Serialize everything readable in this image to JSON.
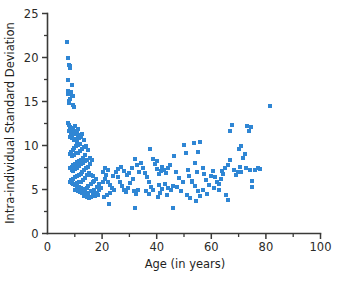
{
  "figure": {
    "background_color": "#ffffff",
    "marker_color": "#2f86d4",
    "axis_color": "#3a3a38",
    "text_color": "#1f1f1e"
  },
  "chart_data": {
    "type": "scatter",
    "title": "",
    "subtitle": "",
    "xlabel": "Age (in years)",
    "ylabel": "Intra-individual Standard Deviation",
    "xlim": [
      0,
      100
    ],
    "ylim": [
      0,
      25
    ],
    "x_major_ticks": [
      0,
      20,
      40,
      60,
      80,
      100
    ],
    "x_minor_ticks": [
      10,
      30,
      50,
      70,
      90
    ],
    "y_major_ticks": [
      0,
      5,
      10,
      15,
      20,
      25
    ],
    "y_minor_ticks": [
      2.5,
      7.5,
      12.5,
      17.5,
      22.5
    ],
    "x_tick_labels": [
      "0",
      "20",
      "40",
      "60",
      "80",
      "100"
    ],
    "y_tick_labels": [
      "0",
      "5",
      "10",
      "15",
      "20",
      "25"
    ],
    "grid": false,
    "legend": null,
    "marker": "square",
    "marker_size": 4,
    "series": [
      {
        "name": "Participants",
        "color": "#2f86d4",
        "points": [
          [
            7.2,
            21.8
          ],
          [
            7.4,
            19.9
          ],
          [
            7.8,
            19.2
          ],
          [
            8.1,
            18.8
          ],
          [
            8.3,
            19.0
          ],
          [
            7.6,
            17.4
          ],
          [
            9.0,
            16.9
          ],
          [
            7.5,
            16.2
          ],
          [
            7.4,
            15.8
          ],
          [
            8.6,
            16.1
          ],
          [
            8.9,
            15.6
          ],
          [
            8.2,
            15.3
          ],
          [
            7.8,
            15.1
          ],
          [
            9.3,
            15.6
          ],
          [
            9.5,
            14.6
          ],
          [
            8.0,
            14.8
          ],
          [
            9.8,
            14.4
          ],
          [
            7.6,
            12.6
          ],
          [
            8.0,
            12.3
          ],
          [
            8.4,
            12.1
          ],
          [
            8.8,
            12.0
          ],
          [
            9.1,
            11.9
          ],
          [
            7.9,
            11.6
          ],
          [
            8.6,
            11.4
          ],
          [
            9.4,
            11.8
          ],
          [
            10.0,
            12.2
          ],
          [
            10.4,
            11.7
          ],
          [
            9.7,
            11.3
          ],
          [
            10.8,
            11.5
          ],
          [
            11.3,
            11.9
          ],
          [
            11.0,
            11.2
          ],
          [
            8.3,
            11.0
          ],
          [
            9.0,
            10.9
          ],
          [
            9.6,
            10.6
          ],
          [
            10.2,
            10.7
          ],
          [
            10.9,
            10.4
          ],
          [
            11.6,
            10.8
          ],
          [
            12.2,
            11.0
          ],
          [
            12.8,
            11.3
          ],
          [
            13.4,
            10.6
          ],
          [
            12.0,
            10.2
          ],
          [
            11.2,
            10.1
          ],
          [
            10.5,
            9.9
          ],
          [
            9.8,
            9.7
          ],
          [
            9.2,
            9.5
          ],
          [
            8.7,
            9.3
          ],
          [
            8.2,
            9.0
          ],
          [
            9.0,
            8.8
          ],
          [
            9.6,
            8.9
          ],
          [
            10.3,
            9.1
          ],
          [
            11.0,
            9.2
          ],
          [
            11.8,
            9.4
          ],
          [
            12.5,
            9.6
          ],
          [
            13.2,
            9.8
          ],
          [
            14.0,
            10.0
          ],
          [
            14.8,
            9.5
          ],
          [
            13.8,
            8.9
          ],
          [
            13.0,
            8.6
          ],
          [
            12.3,
            8.4
          ],
          [
            11.5,
            8.2
          ],
          [
            10.8,
            8.1
          ],
          [
            10.1,
            7.9
          ],
          [
            9.4,
            7.8
          ],
          [
            8.8,
            7.6
          ],
          [
            8.3,
            7.4
          ],
          [
            8.9,
            7.2
          ],
          [
            9.5,
            7.1
          ],
          [
            10.2,
            7.3
          ],
          [
            10.9,
            7.5
          ],
          [
            11.6,
            7.7
          ],
          [
            12.4,
            7.9
          ],
          [
            13.1,
            8.0
          ],
          [
            13.9,
            8.2
          ],
          [
            14.6,
            8.4
          ],
          [
            15.4,
            8.6
          ],
          [
            16.2,
            8.3
          ],
          [
            15.6,
            7.9
          ],
          [
            14.9,
            7.6
          ],
          [
            14.2,
            7.4
          ],
          [
            13.5,
            7.2
          ],
          [
            12.8,
            7.0
          ],
          [
            12.1,
            6.8
          ],
          [
            11.4,
            6.7
          ],
          [
            10.7,
            6.5
          ],
          [
            10.0,
            6.4
          ],
          [
            9.3,
            6.2
          ],
          [
            8.7,
            6.1
          ],
          [
            8.2,
            5.9
          ],
          [
            8.8,
            5.7
          ],
          [
            9.4,
            5.6
          ],
          [
            10.1,
            5.5
          ],
          [
            10.8,
            5.4
          ],
          [
            11.5,
            5.3
          ],
          [
            12.2,
            5.2
          ],
          [
            12.9,
            5.1
          ],
          [
            13.6,
            5.0
          ],
          [
            14.3,
            5.2
          ],
          [
            15.0,
            5.4
          ],
          [
            15.8,
            5.6
          ],
          [
            16.5,
            5.8
          ],
          [
            17.2,
            6.0
          ],
          [
            17.9,
            6.2
          ],
          [
            16.8,
            6.5
          ],
          [
            16.0,
            6.7
          ],
          [
            15.2,
            6.9
          ],
          [
            14.5,
            6.6
          ],
          [
            13.8,
            6.3
          ],
          [
            13.0,
            6.1
          ],
          [
            12.3,
            5.9
          ],
          [
            11.6,
            5.8
          ],
          [
            10.9,
            5.7
          ],
          [
            10.2,
            4.9
          ],
          [
            11.0,
            4.8
          ],
          [
            11.8,
            4.7
          ],
          [
            12.6,
            4.6
          ],
          [
            13.4,
            4.5
          ],
          [
            14.2,
            4.4
          ],
          [
            15.0,
            4.6
          ],
          [
            15.8,
            4.8
          ],
          [
            16.6,
            4.5
          ],
          [
            17.4,
            4.3
          ],
          [
            18.2,
            4.6
          ],
          [
            16.0,
            4.1
          ],
          [
            15.1,
            4.0
          ],
          [
            14.3,
            4.2
          ],
          [
            13.5,
            4.3
          ],
          [
            17.0,
            5.0
          ],
          [
            18.0,
            5.3
          ],
          [
            18.8,
            5.6
          ],
          [
            19.5,
            5.2
          ],
          [
            19.0,
            4.9
          ],
          [
            18.4,
            4.4
          ],
          [
            20.2,
            5.8
          ],
          [
            20.9,
            6.2
          ],
          [
            21.6,
            6.7
          ],
          [
            22.3,
            7.2
          ],
          [
            21.0,
            7.4
          ],
          [
            20.3,
            7.0
          ],
          [
            22.0,
            5.9
          ],
          [
            22.8,
            5.5
          ],
          [
            23.5,
            5.2
          ],
          [
            24.2,
            4.9
          ],
          [
            23.0,
            4.6
          ],
          [
            21.8,
            4.4
          ],
          [
            20.6,
            4.2
          ],
          [
            22.5,
            3.4
          ],
          [
            24.0,
            6.5
          ],
          [
            25.0,
            7.0
          ],
          [
            25.8,
            6.4
          ],
          [
            26.5,
            5.9
          ],
          [
            27.2,
            5.4
          ],
          [
            28.0,
            5.0
          ],
          [
            28.8,
            4.7
          ],
          [
            29.6,
            5.2
          ],
          [
            30.4,
            5.7
          ],
          [
            31.2,
            6.2
          ],
          [
            26.0,
            7.3
          ],
          [
            27.0,
            7.6
          ],
          [
            28.2,
            7.1
          ],
          [
            29.2,
            6.6
          ],
          [
            30.0,
            6.9
          ],
          [
            31.0,
            7.4
          ],
          [
            32.0,
            8.5
          ],
          [
            32.8,
            7.8
          ],
          [
            33.5,
            7.0
          ],
          [
            31.5,
            4.8
          ],
          [
            32.5,
            4.5
          ],
          [
            33.2,
            5.0
          ],
          [
            32.0,
            2.9
          ],
          [
            34.2,
            8.0
          ],
          [
            35.0,
            7.5
          ],
          [
            35.8,
            6.9
          ],
          [
            36.5,
            6.4
          ],
          [
            37.2,
            5.8
          ],
          [
            38.0,
            5.3
          ],
          [
            36.0,
            4.8
          ],
          [
            37.0,
            4.5
          ],
          [
            38.5,
            4.9
          ],
          [
            37.5,
            9.6
          ],
          [
            38.8,
            8.5
          ],
          [
            39.5,
            7.9
          ],
          [
            40.2,
            7.3
          ],
          [
            40.8,
            6.8
          ],
          [
            41.5,
            7.1
          ],
          [
            40.0,
            8.2
          ],
          [
            41.0,
            5.5
          ],
          [
            41.8,
            5.1
          ],
          [
            40.5,
            4.2
          ],
          [
            41.2,
            4.6
          ],
          [
            42.0,
            7.6
          ],
          [
            42.8,
            7.2
          ],
          [
            43.5,
            6.9
          ],
          [
            44.2,
            7.4
          ],
          [
            45.0,
            7.8
          ],
          [
            43.0,
            5.6
          ],
          [
            44.0,
            5.2
          ],
          [
            45.2,
            4.9
          ],
          [
            43.8,
            4.4
          ],
          [
            45.8,
            5.4
          ],
          [
            46.0,
            2.9
          ],
          [
            46.5,
            8.8
          ],
          [
            47.2,
            7.0
          ],
          [
            48.0,
            6.3
          ],
          [
            47.5,
            5.3
          ],
          [
            48.8,
            4.8
          ],
          [
            49.5,
            5.9
          ],
          [
            50.0,
            10.1
          ],
          [
            50.8,
            9.1
          ],
          [
            51.5,
            7.2
          ],
          [
            52.0,
            6.5
          ],
          [
            52.8,
            5.8
          ],
          [
            51.0,
            4.4
          ],
          [
            52.2,
            4.0
          ],
          [
            53.5,
            10.3
          ],
          [
            54.2,
            8.0
          ],
          [
            55.0,
            9.3
          ],
          [
            55.8,
            10.4
          ],
          [
            54.8,
            7.0
          ],
          [
            53.0,
            6.0
          ],
          [
            54.0,
            5.4
          ],
          [
            55.2,
            4.8
          ],
          [
            56.0,
            4.3
          ],
          [
            54.5,
            3.7
          ],
          [
            56.8,
            7.5
          ],
          [
            57.5,
            6.8
          ],
          [
            58.2,
            6.1
          ],
          [
            59.0,
            5.5
          ],
          [
            57.0,
            5.0
          ],
          [
            58.5,
            4.5
          ],
          [
            59.8,
            6.5
          ],
          [
            60.5,
            7.1
          ],
          [
            61.2,
            6.4
          ],
          [
            62.0,
            5.8
          ],
          [
            61.0,
            5.2
          ],
          [
            62.8,
            5.6
          ],
          [
            63.5,
            6.2
          ],
          [
            64.2,
            6.8
          ],
          [
            65.0,
            7.5
          ],
          [
            64.0,
            7.1
          ],
          [
            63.0,
            4.9
          ],
          [
            65.5,
            4.4
          ],
          [
            66.2,
            3.8
          ],
          [
            66.0,
            7.8
          ],
          [
            66.8,
            11.6
          ],
          [
            67.5,
            12.3
          ],
          [
            67.0,
            8.3
          ],
          [
            68.2,
            7.2
          ],
          [
            69.0,
            6.6
          ],
          [
            69.8,
            7.0
          ],
          [
            70.5,
            7.6
          ],
          [
            70.0,
            9.6
          ],
          [
            70.8,
            9.9
          ],
          [
            71.5,
            8.6
          ],
          [
            72.2,
            9.0
          ],
          [
            71.0,
            7.0
          ],
          [
            72.8,
            7.5
          ],
          [
            73.0,
            12.2
          ],
          [
            73.8,
            11.6
          ],
          [
            74.5,
            12.1
          ],
          [
            74.0,
            7.2
          ],
          [
            75.0,
            6.0
          ],
          [
            74.8,
            5.3
          ],
          [
            76.0,
            7.2
          ],
          [
            77.0,
            7.5
          ],
          [
            78.0,
            7.3
          ],
          [
            81.5,
            14.5
          ]
        ]
      }
    ]
  }
}
